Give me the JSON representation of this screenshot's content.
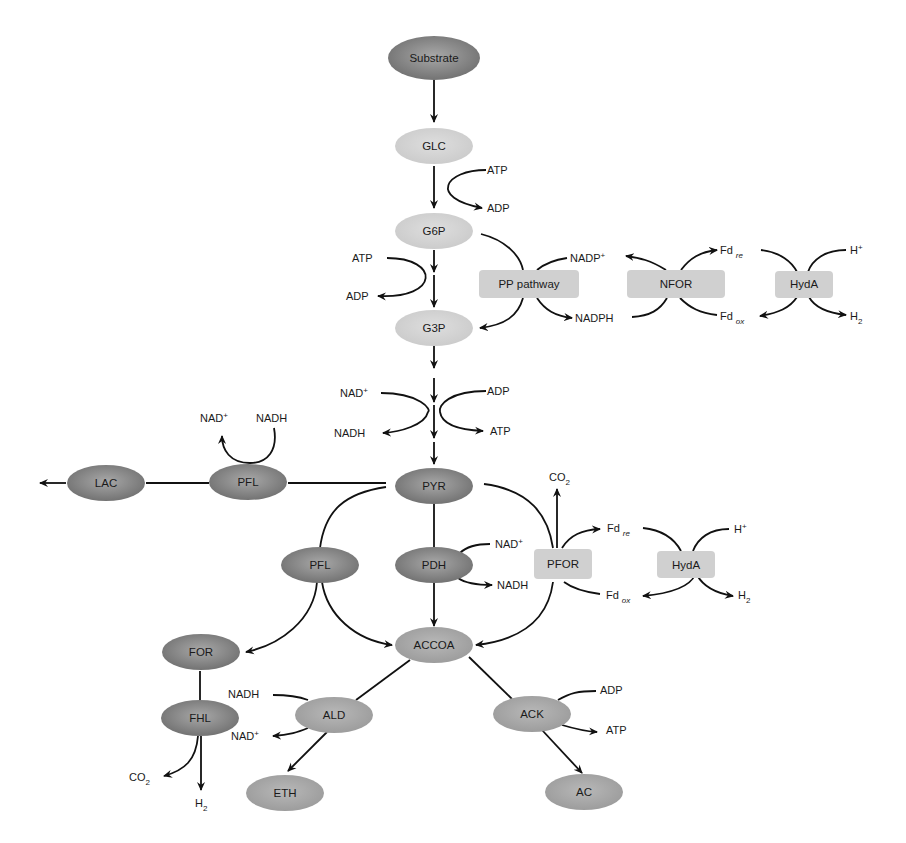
{
  "colors": {
    "dark_node": "#8a8a8a",
    "mid_node": "#a6a6a6",
    "light_node": "#d2d2d2",
    "enzyme_box": "#d0d0d0",
    "edge": "#111111"
  },
  "nodes": {
    "substrate": {
      "label": "Substrate",
      "shade": "dark"
    },
    "glc": {
      "label": "GLC",
      "shade": "light"
    },
    "g6p": {
      "label": "G6P",
      "shade": "light"
    },
    "g3p": {
      "label": "G3P",
      "shade": "light"
    },
    "pyr": {
      "label": "PYR",
      "shade": "dark"
    },
    "lac": {
      "label": "LAC",
      "shade": "dark"
    },
    "pfl_left": {
      "label": "PFL",
      "shade": "dark"
    },
    "pfl": {
      "label": "PFL",
      "shade": "dark"
    },
    "pdh": {
      "label": "PDH",
      "shade": "dark"
    },
    "accoa": {
      "label": "ACCOA",
      "shade": "mid"
    },
    "for": {
      "label": "FOR",
      "shade": "dark"
    },
    "fhl": {
      "label": "FHL",
      "shade": "dark"
    },
    "ald": {
      "label": "ALD",
      "shade": "mid"
    },
    "ack": {
      "label": "ACK",
      "shade": "mid"
    },
    "eth": {
      "label": "ETH",
      "shade": "mid"
    },
    "ac": {
      "label": "AC",
      "shade": "mid"
    }
  },
  "boxes": {
    "pp_pathway": "PP pathway",
    "nfor": "NFOR",
    "hyda_top": "HydA",
    "pfor": "PFOR",
    "hyda_mid": "HydA"
  },
  "cofactors": {
    "atp_glc": "ATP",
    "adp_glc": "ADP",
    "atp_g6p": "ATP",
    "adp_g6p": "ADP",
    "nadp_plus": "NADP",
    "nadph": "NADPH",
    "fd_re_top": "Fd",
    "fd_ox_top": "Fd",
    "h_plus_top": "H",
    "h2_top": "H",
    "nad_plus_gly": "NAD",
    "nadh_gly": "NADH",
    "adp_gly": "ADP",
    "atp_gly": "ATP",
    "nad_plus_lac": "NAD",
    "nadh_lac": "NADH",
    "co2_pfor": "CO",
    "nad_plus_pdh": "NAD",
    "nadh_pdh": "NADH",
    "fd_re_mid": "Fd",
    "fd_ox_mid": "Fd",
    "h_plus_mid": "H",
    "h2_mid": "H",
    "nadh_ald": "NADH",
    "nad_plus_ald": "NAD",
    "adp_ack": "ADP",
    "atp_ack": "ATP",
    "co2_fhl": "CO",
    "h2_fhl": "H"
  },
  "scripts": {
    "plus": "+",
    "two": "2",
    "re": "re",
    "ox": "ox"
  }
}
